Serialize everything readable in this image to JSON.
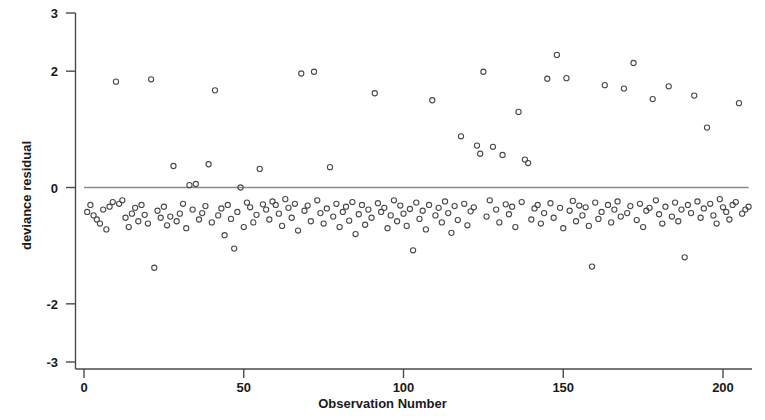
{
  "chart_data": {
    "type": "scatter",
    "title": "",
    "xlabel": "Observation Number",
    "ylabel": "deviance residual",
    "xlim": [
      -4,
      214
    ],
    "ylim": [
      -3,
      3
    ],
    "xticks": [
      0,
      50,
      100,
      150,
      200
    ],
    "yticks": [
      3,
      2,
      0,
      -2,
      -3
    ],
    "xtick_labels": [
      "0",
      "50",
      "100",
      "150",
      "200"
    ],
    "ytick_labels": [
      "3",
      "2",
      "0",
      "-2",
      "-3"
    ],
    "grid": false,
    "legend": "none",
    "marker": "open-circle",
    "marker_color": "#4a4a4a",
    "reference_line": {
      "orientation": "horizontal",
      "y": 0,
      "color": "#8a8a8a",
      "x_start": 0,
      "x_end": 208
    },
    "series": [
      {
        "name": "deviance residual",
        "points": [
          [
            1,
            -0.42
          ],
          [
            2,
            -0.3
          ],
          [
            3,
            -0.48
          ],
          [
            4,
            -0.55
          ],
          [
            5,
            -0.62
          ],
          [
            6,
            -0.38
          ],
          [
            7,
            -0.72
          ],
          [
            8,
            -0.33
          ],
          [
            9,
            -0.25
          ],
          [
            10,
            1.82
          ],
          [
            11,
            -0.28
          ],
          [
            12,
            -0.22
          ],
          [
            13,
            -0.52
          ],
          [
            14,
            -0.68
          ],
          [
            15,
            -0.45
          ],
          [
            16,
            -0.35
          ],
          [
            17,
            -0.58
          ],
          [
            18,
            -0.3
          ],
          [
            19,
            -0.47
          ],
          [
            20,
            -0.62
          ],
          [
            21,
            1.86
          ],
          [
            22,
            -1.38
          ],
          [
            23,
            -0.4
          ],
          [
            24,
            -0.52
          ],
          [
            25,
            -0.33
          ],
          [
            26,
            -0.65
          ],
          [
            27,
            -0.5
          ],
          [
            28,
            0.37
          ],
          [
            29,
            -0.58
          ],
          [
            30,
            -0.45
          ],
          [
            31,
            -0.28
          ],
          [
            32,
            -0.7
          ],
          [
            33,
            0.04
          ],
          [
            34,
            -0.38
          ],
          [
            35,
            0.06
          ],
          [
            36,
            -0.55
          ],
          [
            37,
            -0.44
          ],
          [
            38,
            -0.32
          ],
          [
            39,
            0.4
          ],
          [
            40,
            -0.6
          ],
          [
            41,
            1.67
          ],
          [
            42,
            -0.48
          ],
          [
            43,
            -0.36
          ],
          [
            44,
            -0.82
          ],
          [
            45,
            -0.3
          ],
          [
            46,
            -0.54
          ],
          [
            47,
            -1.05
          ],
          [
            48,
            -0.42
          ],
          [
            49,
            0.0
          ],
          [
            50,
            -0.68
          ],
          [
            51,
            -0.26
          ],
          [
            52,
            -0.34
          ],
          [
            53,
            -0.6
          ],
          [
            54,
            -0.47
          ],
          [
            55,
            0.32
          ],
          [
            56,
            -0.29
          ],
          [
            57,
            -0.38
          ],
          [
            58,
            -0.55
          ],
          [
            59,
            -0.24
          ],
          [
            60,
            -0.3
          ],
          [
            61,
            -0.45
          ],
          [
            62,
            -0.66
          ],
          [
            63,
            -0.2
          ],
          [
            64,
            -0.35
          ],
          [
            65,
            -0.52
          ],
          [
            66,
            -0.28
          ],
          [
            67,
            -0.74
          ],
          [
            68,
            1.96
          ],
          [
            69,
            -0.4
          ],
          [
            70,
            -0.31
          ],
          [
            71,
            -0.58
          ],
          [
            72,
            1.99
          ],
          [
            73,
            -0.22
          ],
          [
            74,
            -0.44
          ],
          [
            75,
            -0.62
          ],
          [
            76,
            -0.36
          ],
          [
            77,
            0.35
          ],
          [
            78,
            -0.5
          ],
          [
            79,
            -0.28
          ],
          [
            80,
            -0.68
          ],
          [
            81,
            -0.42
          ],
          [
            82,
            -0.33
          ],
          [
            83,
            -0.57
          ],
          [
            84,
            -0.25
          ],
          [
            85,
            -0.8
          ],
          [
            86,
            -0.46
          ],
          [
            87,
            -0.3
          ],
          [
            88,
            -0.64
          ],
          [
            89,
            -0.38
          ],
          [
            90,
            -0.52
          ],
          [
            91,
            1.62
          ],
          [
            92,
            -0.27
          ],
          [
            93,
            -0.42
          ],
          [
            94,
            -0.35
          ],
          [
            95,
            -0.7
          ],
          [
            96,
            -0.48
          ],
          [
            97,
            -0.22
          ],
          [
            98,
            -0.58
          ],
          [
            99,
            -0.31
          ],
          [
            100,
            -0.45
          ],
          [
            101,
            -0.66
          ],
          [
            102,
            -0.37
          ],
          [
            103,
            -1.08
          ],
          [
            104,
            -0.26
          ],
          [
            105,
            -0.54
          ],
          [
            106,
            -0.4
          ],
          [
            107,
            -0.72
          ],
          [
            108,
            -0.3
          ],
          [
            109,
            1.5
          ],
          [
            110,
            -0.48
          ],
          [
            111,
            -0.35
          ],
          [
            112,
            -0.6
          ],
          [
            113,
            -0.24
          ],
          [
            114,
            -0.44
          ],
          [
            115,
            -0.78
          ],
          [
            116,
            -0.32
          ],
          [
            117,
            -0.56
          ],
          [
            118,
            0.88
          ],
          [
            119,
            -0.28
          ],
          [
            120,
            -0.65
          ],
          [
            121,
            -0.41
          ],
          [
            122,
            -0.34
          ],
          [
            123,
            0.72
          ],
          [
            124,
            0.58
          ],
          [
            125,
            1.99
          ],
          [
            126,
            -0.5
          ],
          [
            127,
            -0.22
          ],
          [
            128,
            0.7
          ],
          [
            129,
            -0.38
          ],
          [
            130,
            -0.6
          ],
          [
            131,
            0.56
          ],
          [
            132,
            -0.29
          ],
          [
            133,
            -0.46
          ],
          [
            134,
            -0.33
          ],
          [
            135,
            -0.68
          ],
          [
            136,
            1.3
          ],
          [
            137,
            -0.25
          ],
          [
            138,
            0.48
          ],
          [
            139,
            0.42
          ],
          [
            140,
            -0.55
          ],
          [
            141,
            -0.36
          ],
          [
            142,
            -0.3
          ],
          [
            143,
            -0.62
          ],
          [
            144,
            -0.44
          ],
          [
            145,
            1.87
          ],
          [
            146,
            -0.27
          ],
          [
            147,
            -0.52
          ],
          [
            148,
            2.28
          ],
          [
            149,
            -0.35
          ],
          [
            150,
            -0.7
          ],
          [
            151,
            1.88
          ],
          [
            152,
            -0.4
          ],
          [
            153,
            -0.23
          ],
          [
            154,
            -0.58
          ],
          [
            155,
            -0.31
          ],
          [
            156,
            -0.48
          ],
          [
            157,
            -0.34
          ],
          [
            158,
            -0.66
          ],
          [
            159,
            -1.36
          ],
          [
            160,
            -0.26
          ],
          [
            161,
            -0.54
          ],
          [
            162,
            -0.42
          ],
          [
            163,
            1.76
          ],
          [
            164,
            -0.3
          ],
          [
            165,
            -0.6
          ],
          [
            166,
            -0.38
          ],
          [
            167,
            -0.24
          ],
          [
            168,
            -0.5
          ],
          [
            169,
            1.7
          ],
          [
            170,
            -0.44
          ],
          [
            171,
            -0.32
          ],
          [
            172,
            2.14
          ],
          [
            173,
            -0.56
          ],
          [
            174,
            -0.28
          ],
          [
            175,
            -0.68
          ],
          [
            176,
            -0.4
          ],
          [
            177,
            -0.35
          ],
          [
            178,
            1.52
          ],
          [
            179,
            -0.22
          ],
          [
            180,
            -0.46
          ],
          [
            181,
            -0.62
          ],
          [
            182,
            -0.33
          ],
          [
            183,
            1.74
          ],
          [
            184,
            -0.5
          ],
          [
            185,
            -0.26
          ],
          [
            186,
            -0.58
          ],
          [
            187,
            -0.38
          ],
          [
            188,
            -1.2
          ],
          [
            189,
            -0.3
          ],
          [
            190,
            -0.44
          ],
          [
            191,
            1.58
          ],
          [
            192,
            -0.24
          ],
          [
            193,
            -0.52
          ],
          [
            194,
            -0.36
          ],
          [
            195,
            1.03
          ],
          [
            196,
            -0.28
          ],
          [
            197,
            -0.48
          ],
          [
            198,
            -0.62
          ],
          [
            199,
            -0.2
          ],
          [
            200,
            -0.34
          ],
          [
            201,
            -0.42
          ],
          [
            202,
            -0.55
          ],
          [
            203,
            -0.3
          ],
          [
            204,
            -0.25
          ],
          [
            205,
            1.45
          ],
          [
            206,
            -0.45
          ],
          [
            207,
            -0.38
          ],
          [
            208,
            -0.33
          ]
        ]
      }
    ]
  },
  "axes": {
    "x_axis_name": "Observation Number",
    "y_axis_name": "deviance residual"
  }
}
